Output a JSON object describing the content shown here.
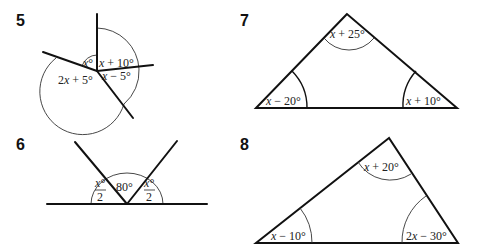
{
  "problems": [
    {
      "number": "5",
      "type": "angles-at-a-point",
      "angles": [
        {
          "label_var": "x",
          "label_rest": "°"
        },
        {
          "label_var": "x",
          "label_rest": " + 10°"
        },
        {
          "label_var": "x",
          "label_rest": " − 5°"
        },
        {
          "label_pre": "2",
          "label_var": "x",
          "label_rest": " + 5°"
        }
      ]
    },
    {
      "number": "6",
      "type": "angles-on-a-straight-line",
      "angles": [
        {
          "numerator": "x°",
          "denominator": "2"
        },
        {
          "label": "80°"
        },
        {
          "numerator": "x°",
          "denominator": "2"
        }
      ]
    },
    {
      "number": "7",
      "type": "triangle",
      "angles": [
        {
          "position": "top",
          "label_var": "x",
          "label_rest": " + 25°"
        },
        {
          "position": "bottom-left",
          "label_var": "x",
          "label_rest": " − 20°"
        },
        {
          "position": "bottom-right",
          "label_var": "x",
          "label_rest": " + 10°"
        }
      ]
    },
    {
      "number": "8",
      "type": "triangle",
      "angles": [
        {
          "position": "top",
          "label_var": "x",
          "label_rest": " + 20°"
        },
        {
          "position": "bottom-left",
          "label_var": "x",
          "label_rest": " − 10°"
        },
        {
          "position": "bottom-right",
          "label_pre": "2",
          "label_var": "x",
          "label_rest": " − 30°"
        }
      ]
    }
  ]
}
